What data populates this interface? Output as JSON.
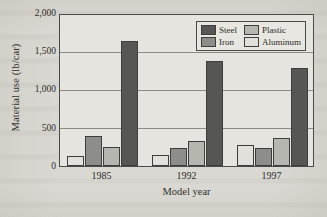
{
  "chart_data": {
    "type": "bar",
    "title": "",
    "xlabel": "Model year",
    "ylabel": "Material use (lb/car)",
    "categories": [
      "1985",
      "1992",
      "1997"
    ],
    "ylim": [
      0,
      2000
    ],
    "yticks": [
      0,
      500,
      1000,
      1500,
      2000
    ],
    "ytick_labels": [
      "0",
      "500",
      "1,000",
      "1,500",
      "2,000"
    ],
    "grid": true,
    "legend_position": "top-right",
    "bar_order_in_group": [
      "Aluminum",
      "Iron",
      "Plastic",
      "Steel"
    ],
    "series": [
      {
        "name": "Steel",
        "color": "#565654",
        "values": [
          1650,
          1385,
          1300
        ]
      },
      {
        "name": "Iron",
        "color": "#8d8d8a",
        "values": [
          400,
          240,
          235
        ]
      },
      {
        "name": "Plastic",
        "color": "#b6b6b1",
        "values": [
          250,
          325,
          375
        ]
      },
      {
        "name": "Aluminum",
        "color": "#e2e0da",
        "values": [
          135,
          145,
          280
        ]
      }
    ]
  },
  "axes": {
    "y_title": "Material use (lb/car)",
    "x_title": "Model year",
    "y_tick_labels": [
      "2,000",
      "1,500",
      "1,000",
      "500",
      "0"
    ],
    "x_tick_labels": [
      "1985",
      "1992",
      "1997"
    ]
  },
  "legend": {
    "items": [
      {
        "label": "Steel",
        "swatch": "steel-swatch"
      },
      {
        "label": "Plastic",
        "swatch": "plastic-swatch"
      },
      {
        "label": "Iron",
        "swatch": "iron-swatch"
      },
      {
        "label": "Aluminum",
        "swatch": "aluminum-swatch"
      }
    ]
  },
  "colors": {
    "steel": "#565654",
    "iron": "#8d8d8a",
    "plastic": "#b6b6b1",
    "aluminum": "#e2e0da",
    "frame": "#4a4a48",
    "grid": "#8d8b86",
    "plot_background": "#e6e4de",
    "page_background": "#dad8d2"
  }
}
